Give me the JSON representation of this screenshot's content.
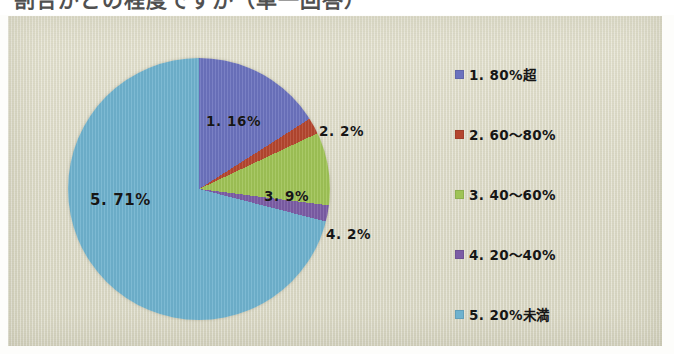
{
  "document": {
    "title_partial": "割合がどの程度ですか（単一回答）",
    "panel_background": "#dcdac6"
  },
  "chart_data": {
    "type": "pie",
    "title": "",
    "start_angle_deg": 0,
    "direction": "clockwise",
    "legend_position": "right",
    "categories": [
      "1. 80%超",
      "2. 60〜80%",
      "3. 40〜60%",
      "4. 20〜40%",
      "5. 20%未満"
    ],
    "values": [
      16,
      2,
      9,
      2,
      71
    ],
    "value_unit": "%",
    "colors": [
      "#6b72be",
      "#b4462f",
      "#9fc356",
      "#7b5ca5",
      "#6fb2ce"
    ],
    "data_labels": [
      "1. 16%",
      "2. 2%",
      "3. 9%",
      "4. 2%",
      "5. 71%"
    ],
    "slices": [
      {
        "index": 1,
        "label": "1. 16%",
        "legend": "1. 80%超",
        "value": 16,
        "color": "#6b72be"
      },
      {
        "index": 2,
        "label": "2. 2%",
        "legend": "2. 60〜80%",
        "value": 2,
        "color": "#b4462f"
      },
      {
        "index": 3,
        "label": "3. 9%",
        "legend": "3. 40〜60%",
        "value": 9,
        "color": "#9fc356"
      },
      {
        "index": 4,
        "label": "4. 2%",
        "legend": "4. 20〜40%",
        "value": 2,
        "color": "#7b5ca5"
      },
      {
        "index": 5,
        "label": "5. 71%",
        "legend": "5. 20%未満",
        "value": 71,
        "color": "#6fb2ce"
      }
    ]
  },
  "legend": {
    "items": [
      {
        "label": "1. 80%超",
        "color": "#6b72be"
      },
      {
        "label": "2. 60〜80%",
        "color": "#b4462f"
      },
      {
        "label": "3. 40〜60%",
        "color": "#9fc356"
      },
      {
        "label": "4. 20〜40%",
        "color": "#7b5ca5"
      },
      {
        "label": "5. 20%未満",
        "color": "#6fb2ce"
      }
    ]
  }
}
